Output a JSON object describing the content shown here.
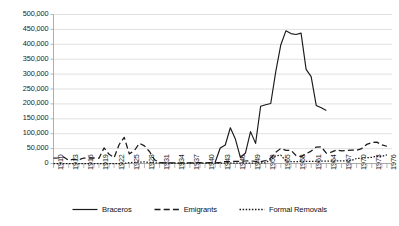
{
  "chart_data": {
    "type": "line",
    "title": "",
    "subtitle": "",
    "xlabel": "",
    "ylabel": "",
    "xlim": [
      1910,
      1977
    ],
    "ylim": [
      0,
      500000
    ],
    "ytick_step": 50000,
    "ytick_labels": [
      "0",
      "50,000",
      "100,000",
      "150,000",
      "200,000",
      "250,000",
      "300,000",
      "350,000",
      "400,000",
      "450,000",
      "500,000"
    ],
    "ytick_values": [
      0,
      50000,
      100000,
      150000,
      200000,
      250000,
      300000,
      350000,
      400000,
      450000,
      500000
    ],
    "xtick_labels": [
      "1910",
      "1913",
      "1916",
      "1919",
      "1922",
      "1925",
      "1928",
      "1931",
      "1934",
      "1937",
      "1940",
      "1943",
      "1946",
      "1949",
      "1952",
      "1955",
      "1958",
      "1961",
      "1964",
      "1967",
      "1970",
      "1973",
      "1976"
    ],
    "xtick_values": [
      1910,
      1913,
      1916,
      1919,
      1922,
      1925,
      1928,
      1931,
      1934,
      1937,
      1940,
      1943,
      1946,
      1949,
      1952,
      1955,
      1958,
      1961,
      1964,
      1967,
      1970,
      1973,
      1976
    ],
    "xtick_minor_step": 1,
    "grid": "horizontal",
    "legend_position": "bottom",
    "line_color": "#1a1a1a",
    "grid_color": "#d4d4d4",
    "axis_color": "#9a9a9a",
    "x": [
      1910,
      1911,
      1912,
      1913,
      1914,
      1915,
      1916,
      1917,
      1918,
      1919,
      1920,
      1921,
      1922,
      1923,
      1924,
      1925,
      1926,
      1927,
      1928,
      1929,
      1930,
      1931,
      1932,
      1933,
      1934,
      1935,
      1936,
      1937,
      1938,
      1939,
      1940,
      1941,
      1942,
      1943,
      1944,
      1945,
      1946,
      1947,
      1948,
      1949,
      1950,
      1951,
      1952,
      1953,
      1954,
      1955,
      1956,
      1957,
      1958,
      1959,
      1960,
      1961,
      1962,
      1963,
      1964,
      1965,
      1966,
      1967,
      1968,
      1969,
      1970,
      1971,
      1972,
      1973,
      1974,
      1975,
      1976
    ],
    "series": [
      {
        "name": "Braceros",
        "style": "solid",
        "values": [
          null,
          null,
          null,
          null,
          null,
          null,
          null,
          null,
          null,
          null,
          null,
          null,
          null,
          null,
          null,
          null,
          null,
          null,
          null,
          null,
          null,
          null,
          null,
          null,
          null,
          null,
          null,
          null,
          null,
          null,
          null,
          null,
          4203,
          52098,
          62170,
          120000,
          82000,
          19632,
          35345,
          107000,
          67500,
          192000,
          197100,
          201380,
          309033,
          398650,
          445197,
          436049,
          432857,
          437643,
          315846,
          291420,
          194978,
          186865,
          177736,
          null,
          null,
          null,
          null,
          null,
          null,
          null,
          null,
          null,
          null,
          null,
          null
        ]
      },
      {
        "name": "Emigrants",
        "style": "dashed",
        "values": [
          17760,
          18784,
          22001,
          10954,
          14614,
          12340,
          18425,
          17869,
          18524,
          17602,
          52361,
          30758,
          19551,
          63768,
          87648,
          32378,
          43316,
          67721,
          59016,
          40154,
          12703,
          3333,
          2171,
          1936,
          1801,
          1560,
          1716,
          2347,
          2502,
          2640,
          2313,
          2824,
          2378,
          4172,
          6598,
          6702,
          7146,
          7558,
          8384,
          8803,
          6744,
          6153,
          9600,
          18454,
          37456,
          50772,
          44181,
          44451,
          26791,
          23061,
          32684,
          41632,
          55291,
          55986,
          34448,
          37969,
          45163,
          42371,
          43563,
          44623,
          44469,
          50103,
          64040,
          70141,
          71586,
          62205,
          57863
        ]
      },
      {
        "name": "Formal Removals",
        "style": "dotted",
        "values": [
          0,
          0,
          0,
          0,
          0,
          0,
          0,
          0,
          0,
          0,
          0,
          0,
          0,
          0,
          0,
          2961,
          4047,
          4495,
          5529,
          2590,
          2559,
          2021,
          1766,
          1258,
          1145,
          1137,
          1181,
          1193,
          1199,
          1288,
          1274,
          1321,
          1360,
          1337,
          1404,
          1355,
          1326,
          1277,
          1272,
          1298,
          1343,
          2125,
          2405,
          14063,
          26091,
          27831,
          9027,
          5904,
          6369,
          6888,
          6855,
          6969,
          7283,
          7714,
          7637,
          8002,
          8535,
          8802,
          9119,
          10505,
          16893,
          17639,
          19420,
          20840,
          24432,
          24004,
          29000
        ]
      }
    ]
  },
  "legend": {
    "items": [
      {
        "label": "Braceros",
        "style": "solid"
      },
      {
        "label": "Emigrants",
        "style": "dashed"
      },
      {
        "label": "Formal Removals",
        "style": "dotted"
      }
    ]
  }
}
